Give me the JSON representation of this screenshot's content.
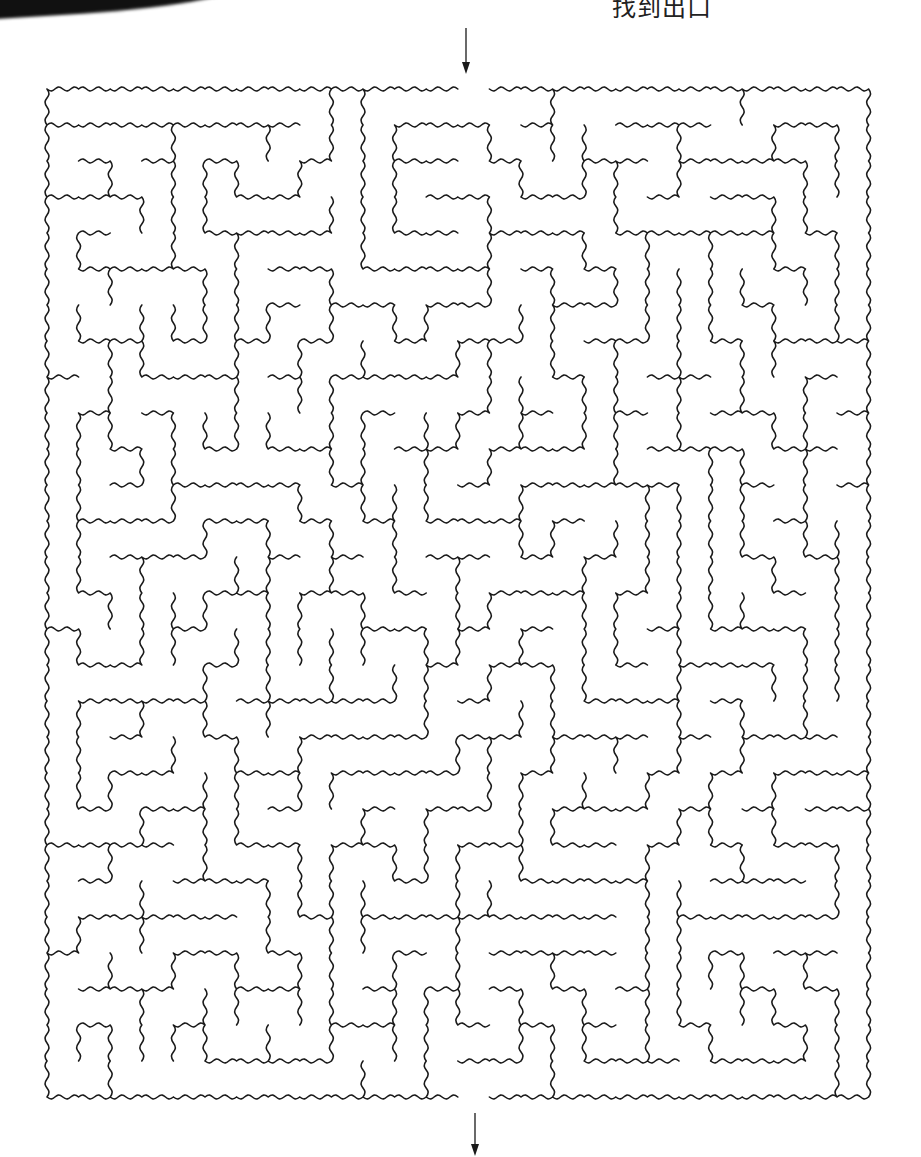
{
  "page": {
    "header_text": "找到出口",
    "background": "#ffffff",
    "ink_color": "#1a1a1a"
  },
  "maze": {
    "cols": 26,
    "rows": 28,
    "origin": {
      "x": 47,
      "y": 89
    },
    "cell_width": 31.6,
    "cell_height": 36.0,
    "wall_style": "wavy-arc",
    "stroke_width": 1.6,
    "seed": 20240611,
    "entrance": {
      "side": "top",
      "col": 13,
      "label": "start"
    },
    "exit": {
      "side": "bottom",
      "col": 13,
      "label": "finish"
    }
  },
  "arrows": {
    "top": {
      "x": 466,
      "y1": 28,
      "y2": 74,
      "direction": "down"
    },
    "bottom": {
      "x": 475,
      "y1": 1113,
      "y2": 1156,
      "direction": "down"
    }
  }
}
